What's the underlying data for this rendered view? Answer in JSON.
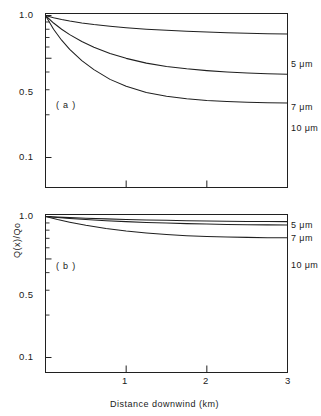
{
  "chart_data": [
    {
      "type": "line",
      "panel": "(a)",
      "title": "",
      "xlabel": "Distance downwind (km)",
      "ylabel": "Q(x)/Qo",
      "yscale": "log",
      "xlim": [
        0,
        3
      ],
      "ylim": [
        0.07,
        1.0
      ],
      "grid": false,
      "legend_position": "right-of-axes",
      "xticks": [
        {
          "value": 0,
          "label": ""
        },
        {
          "value": 1,
          "label": "1"
        },
        {
          "value": 2,
          "label": "2"
        },
        {
          "value": 3,
          "label": "3"
        }
      ],
      "yticks": [
        {
          "value": 1.0,
          "label": "1.0"
        },
        {
          "value": 0.5,
          "label": "0.5"
        },
        {
          "value": 0.1,
          "label": "0.1"
        }
      ],
      "series": [
        {
          "name": "5 μm",
          "x": [
            0,
            0.1,
            0.2,
            0.3,
            0.45,
            0.6,
            0.8,
            1.0,
            1.25,
            1.5,
            1.75,
            2.0,
            2.25,
            2.5,
            2.75,
            3.0
          ],
          "values": [
            1.0,
            0.965,
            0.937,
            0.914,
            0.886,
            0.863,
            0.839,
            0.82,
            0.801,
            0.786,
            0.775,
            0.765,
            0.757,
            0.75,
            0.744,
            0.74
          ]
        },
        {
          "name": "7 μm",
          "x": [
            0,
            0.1,
            0.2,
            0.3,
            0.45,
            0.6,
            0.8,
            1.0,
            1.25,
            1.5,
            1.75,
            2.0,
            2.25,
            2.5,
            2.75,
            3.0
          ],
          "values": [
            1.0,
            0.885,
            0.8,
            0.733,
            0.656,
            0.598,
            0.54,
            0.499,
            0.462,
            0.438,
            0.421,
            0.409,
            0.4,
            0.394,
            0.389,
            0.386
          ]
        },
        {
          "name": "10 μm",
          "x": [
            0,
            0.1,
            0.2,
            0.3,
            0.45,
            0.6,
            0.8,
            1.0,
            1.25,
            1.5,
            1.75,
            2.0,
            2.25,
            2.5,
            2.75,
            3.0
          ],
          "values": [
            1.0,
            0.8,
            0.67,
            0.578,
            0.481,
            0.416,
            0.355,
            0.317,
            0.287,
            0.27,
            0.259,
            0.252,
            0.248,
            0.245,
            0.243,
            0.242
          ]
        }
      ]
    },
    {
      "type": "line",
      "panel": "(b)",
      "title": "",
      "xlabel": "Distance downwind (km)",
      "ylabel": "Q(x)/Qo",
      "yscale": "log",
      "xlim": [
        0,
        3
      ],
      "ylim": [
        0.07,
        1.0
      ],
      "grid": false,
      "legend_position": "right-of-axes",
      "xticks": [
        {
          "value": 0,
          "label": ""
        },
        {
          "value": 1,
          "label": "1"
        },
        {
          "value": 2,
          "label": "2"
        },
        {
          "value": 3,
          "label": "3"
        }
      ],
      "yticks": [
        {
          "value": 1.0,
          "label": "1.0"
        },
        {
          "value": 0.5,
          "label": "0.5"
        },
        {
          "value": 0.1,
          "label": "0.1"
        }
      ],
      "series": [
        {
          "name": "5 μm",
          "x": [
            0,
            0.15,
            0.3,
            0.5,
            0.75,
            1.0,
            1.25,
            1.5,
            1.75,
            2.0,
            2.25,
            2.5,
            2.75,
            3.0
          ],
          "values": [
            1.0,
            0.99,
            0.982,
            0.972,
            0.962,
            0.953,
            0.946,
            0.94,
            0.934,
            0.93,
            0.926,
            0.923,
            0.921,
            0.92
          ]
        },
        {
          "name": "7 μm",
          "x": [
            0,
            0.15,
            0.3,
            0.5,
            0.75,
            1.0,
            1.25,
            1.5,
            1.75,
            2.0,
            2.25,
            2.5,
            2.75,
            3.0
          ],
          "values": [
            1.0,
            0.983,
            0.969,
            0.952,
            0.934,
            0.92,
            0.908,
            0.898,
            0.89,
            0.884,
            0.879,
            0.875,
            0.872,
            0.87
          ]
        },
        {
          "name": "10 μm",
          "x": [
            0,
            0.15,
            0.3,
            0.5,
            0.75,
            1.0,
            1.25,
            1.5,
            1.75,
            2.0,
            2.25,
            2.5,
            2.75,
            3.0
          ],
          "values": [
            1.0,
            0.952,
            0.912,
            0.866,
            0.822,
            0.789,
            0.764,
            0.745,
            0.731,
            0.722,
            0.715,
            0.711,
            0.708,
            0.707
          ]
        }
      ]
    }
  ],
  "axes": {
    "ylabel": "Q(x)/Qo",
    "xlabel": "Distance downwind (km)"
  },
  "panel_a": {
    "tag": "( a )",
    "ytick_1": "1.0",
    "ytick_05": "0.5",
    "ytick_01": "0.1",
    "label_5um": "5 μm",
    "label_7um": "7 μm",
    "label_10um": "10 μm"
  },
  "panel_b": {
    "tag": "( b )",
    "ytick_1": "1.0",
    "ytick_05": "0.5",
    "ytick_01": "0.1",
    "label_5um": "5 μm",
    "label_7um": "7 μm",
    "label_10um": "10 μm",
    "xtick_1": "1",
    "xtick_2": "2",
    "xtick_3": "3"
  },
  "style": {
    "line_color": "#202020",
    "axis_color": "#202020",
    "background": "#ffffff"
  }
}
